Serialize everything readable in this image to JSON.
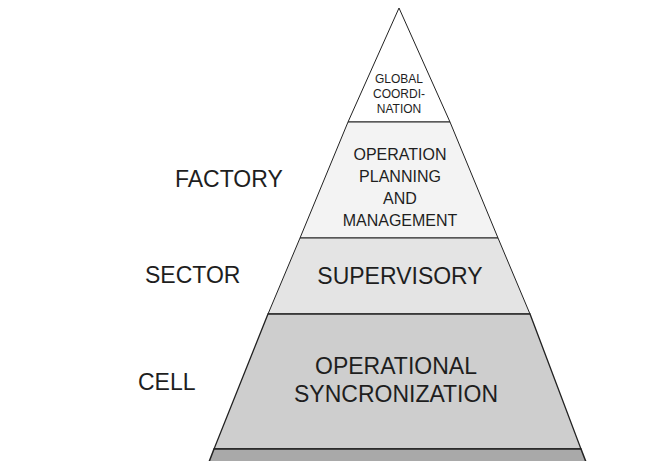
{
  "diagram": {
    "type": "pyramid",
    "levels": [
      {
        "label_lines": [
          "GLOBAL",
          "COORDI-",
          "NATION"
        ],
        "fill": "#ffffff"
      },
      {
        "label_lines": [
          "OPERATION",
          "PLANNING",
          "AND",
          "MANAGEMENT"
        ],
        "fill": "#f3f3f3"
      },
      {
        "label_lines": [
          "SUPERVISORY"
        ],
        "fill": "#e4e4e4"
      },
      {
        "label_lines": [
          "OPERATIONAL",
          "SYNCRONIZATION"
        ],
        "fill": "#cecece"
      },
      {
        "label_lines": [],
        "fill": "#a9a9a9"
      }
    ],
    "side_labels": [
      {
        "text": "FACTORY",
        "level": "OPERATION PLANNING AND MANAGEMENT"
      },
      {
        "text": "SECTOR",
        "level": "SUPERVISORY"
      },
      {
        "text": "CELL",
        "level": "OPERATIONAL SYNCRONIZATION"
      }
    ]
  }
}
